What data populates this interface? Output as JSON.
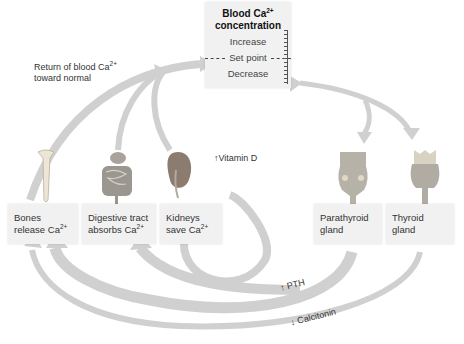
{
  "center_box": {
    "title": "Blood Ca",
    "title_sup": "2+",
    "title_line2": "concentration",
    "levels": [
      "Increase",
      "Set point",
      "Decrease"
    ]
  },
  "return_label": {
    "line1": "Return of blood Ca",
    "sup": "2+",
    "line2": "toward normal"
  },
  "effector_boxes": [
    {
      "id": "bones",
      "line1": "Bones",
      "line2": "release Ca",
      "sup": "2+",
      "organ_icon": "bone-icon"
    },
    {
      "id": "digestive",
      "line1": "Digestive tract",
      "line2": "absorbs Ca",
      "sup": "2+",
      "organ_icon": "digestive-tract-icon"
    },
    {
      "id": "kidneys",
      "line1": "Kidneys",
      "line2": "save Ca",
      "sup": "2+",
      "organ_icon": "kidney-icon"
    }
  ],
  "gland_boxes": [
    {
      "id": "parathyroid",
      "line1": "Parathyroid",
      "line2": "gland",
      "organ_icon": "parathyroid-icon"
    },
    {
      "id": "thyroid",
      "line1": "Thyroid",
      "line2": "gland",
      "organ_icon": "thyroid-icon"
    }
  ],
  "hormone_labels": {
    "vitamin_d": {
      "direction": "up",
      "text": "Vitamin D"
    },
    "pth": {
      "direction": "up",
      "text": "PTH"
    },
    "calcitonin": {
      "direction": "down",
      "text": "Calcitonin"
    }
  },
  "colors": {
    "arrow": "#cfcfcf",
    "box": "#f1f1f1",
    "text": "#333333"
  }
}
